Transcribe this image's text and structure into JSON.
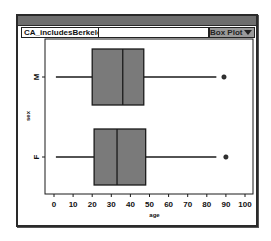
{
  "window": {
    "dataset_name": "CA_includesBerkeley",
    "plot_type_label": "Box Plot",
    "plot_type_menu_icon": "triangle-down-icon"
  },
  "chart_data": {
    "type": "boxplot",
    "orientation": "horizontal",
    "title": "",
    "xlabel": "age",
    "ylabel": "sex",
    "xlim": [
      0,
      100
    ],
    "xticks": [
      0,
      10,
      20,
      30,
      40,
      50,
      60,
      70,
      80,
      90,
      100
    ],
    "categories": [
      "M",
      "F"
    ],
    "series": [
      {
        "name": "M",
        "whisker_low": 1,
        "q1": 20,
        "median": 36,
        "q3": 47,
        "whisker_high": 85,
        "outliers": [
          89
        ]
      },
      {
        "name": "F",
        "whisker_low": 1,
        "q1": 21,
        "median": 33,
        "q3": 48,
        "whisker_high": 85,
        "outliers": [
          90
        ]
      }
    ],
    "box_fill": "#7a7a7a",
    "line_color": "#1a1a1a",
    "grid": false,
    "legend": "none"
  }
}
